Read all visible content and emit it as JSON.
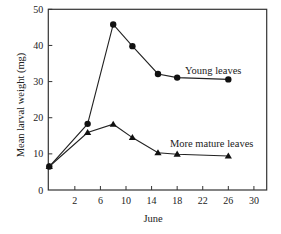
{
  "chart_data": {
    "type": "line",
    "title": "",
    "xlabel": "June",
    "ylabel": "Mean larval weight (mg)",
    "xlim": [
      -2.15,
      32
    ],
    "ylim": [
      0,
      50
    ],
    "grid": false,
    "x_ticks": [
      2,
      6,
      10,
      14,
      18,
      22,
      26,
      30
    ],
    "y_ticks": [
      0,
      10,
      20,
      30,
      40,
      50
    ],
    "legend": "inline labels next to series (right side)",
    "series": [
      {
        "name": "Young leaves",
        "marker": "circle",
        "x": [
          -2,
          4,
          8,
          11,
          15,
          18,
          26
        ],
        "values": [
          6.5,
          18.3,
          45.8,
          39.8,
          32.1,
          31.1,
          30.6
        ]
      },
      {
        "name": "More mature leaves",
        "marker": "triangle",
        "x": [
          -2,
          4,
          8,
          11,
          15,
          18,
          26
        ],
        "values": [
          6.5,
          15.9,
          18.2,
          14.5,
          10.3,
          9.9,
          9.4
        ]
      }
    ]
  }
}
